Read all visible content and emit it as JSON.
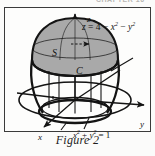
{
  "page": {
    "running_head": "CHAPTER 16",
    "caption": "Figure 2"
  },
  "figure": {
    "surface_label": "S",
    "curve_label": "C",
    "axis_labels": {
      "x": "x",
      "y": "y",
      "z": "z"
    },
    "equations": {
      "surface": {
        "lhs": "z",
        "eq": "=",
        "rhs_a": "4",
        "minus1": "−",
        "rhs_b": "x",
        "exp_b": "2",
        "minus2": "−",
        "rhs_c": "y",
        "exp_c": "2"
      },
      "base_circle": {
        "t1": "x",
        "e1": "2",
        "plus": "+",
        "t2": "y",
        "e2": "2",
        "eq": "=",
        "rhs": "1"
      }
    },
    "colors": {
      "ink": "#141414",
      "cap_fill": "#a9a9a9",
      "cap_fill_light": "#c2c2c2",
      "paper": "#fdfdfc",
      "frame": "#3a3a3a"
    }
  }
}
